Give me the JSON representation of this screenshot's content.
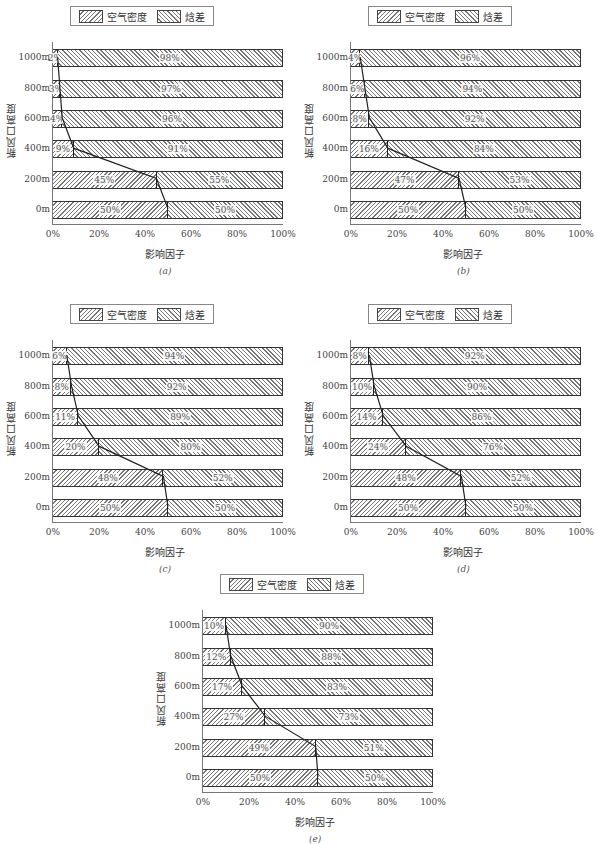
{
  "legend": {
    "series_a": "空气密度",
    "series_b": "焓差"
  },
  "axis": {
    "xlabel": "影响因子",
    "ylabel": "新风口高度",
    "xticks": [
      "0%",
      "20%",
      "40%",
      "60%",
      "80%",
      "100%"
    ],
    "yticks": [
      "0m",
      "200m",
      "400m",
      "600m",
      "800m",
      "1000m"
    ]
  },
  "captions": [
    "(a)",
    "(b)",
    "(c)",
    "(d)",
    "(e)"
  ],
  "chart_data": [
    {
      "type": "bar",
      "stacked": true,
      "orientation": "horizontal",
      "caption": "(a)",
      "categories": [
        "0m",
        "200m",
        "400m",
        "600m",
        "800m",
        "1000m"
      ],
      "series": [
        {
          "name": "空气密度",
          "values": [
            50,
            45,
            9,
            4,
            3,
            2
          ]
        },
        {
          "name": "焓差",
          "values": [
            50,
            55,
            91,
            96,
            97,
            98
          ]
        }
      ],
      "xlabel": "影响因子",
      "ylabel": "新风口高度",
      "xlim": [
        0,
        100
      ],
      "legend_position": "top"
    },
    {
      "type": "bar",
      "stacked": true,
      "orientation": "horizontal",
      "caption": "(b)",
      "categories": [
        "0m",
        "200m",
        "400m",
        "600m",
        "800m",
        "1000m"
      ],
      "series": [
        {
          "name": "空气密度",
          "values": [
            50,
            47,
            16,
            8,
            6,
            4
          ]
        },
        {
          "name": "焓差",
          "values": [
            50,
            53,
            84,
            92,
            94,
            96
          ]
        }
      ],
      "xlabel": "影响因子",
      "ylabel": "新风口高度",
      "xlim": [
        0,
        100
      ],
      "legend_position": "top"
    },
    {
      "type": "bar",
      "stacked": true,
      "orientation": "horizontal",
      "caption": "(c)",
      "categories": [
        "0m",
        "200m",
        "400m",
        "600m",
        "800m",
        "1000m"
      ],
      "series": [
        {
          "name": "空气密度",
          "values": [
            50,
            48,
            20,
            11,
            8,
            6
          ]
        },
        {
          "name": "焓差",
          "values": [
            50,
            52,
            80,
            89,
            92,
            94
          ]
        }
      ],
      "xlabel": "影响因子",
      "ylabel": "新风口高度",
      "xlim": [
        0,
        100
      ],
      "legend_position": "top"
    },
    {
      "type": "bar",
      "stacked": true,
      "orientation": "horizontal",
      "caption": "(d)",
      "categories": [
        "0m",
        "200m",
        "400m",
        "600m",
        "800m",
        "1000m"
      ],
      "series": [
        {
          "name": "空气密度",
          "values": [
            50,
            48,
            24,
            14,
            10,
            8
          ]
        },
        {
          "name": "焓差",
          "values": [
            50,
            52,
            76,
            86,
            90,
            92
          ]
        }
      ],
      "xlabel": "影响因子",
      "ylabel": "新风口高度",
      "xlim": [
        0,
        100
      ],
      "legend_position": "top"
    },
    {
      "type": "bar",
      "stacked": true,
      "orientation": "horizontal",
      "caption": "(e)",
      "categories": [
        "0m",
        "200m",
        "400m",
        "600m",
        "800m",
        "1000m"
      ],
      "series": [
        {
          "name": "空气密度",
          "values": [
            50,
            49,
            27,
            17,
            12,
            10
          ]
        },
        {
          "name": "焓差",
          "values": [
            50,
            51,
            73,
            83,
            88,
            90
          ]
        }
      ],
      "xlabel": "影响因子",
      "ylabel": "新风口高度",
      "xlim": [
        0,
        100
      ],
      "legend_position": "top"
    }
  ]
}
